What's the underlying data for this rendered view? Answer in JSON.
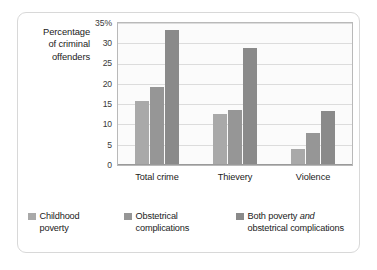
{
  "chart_data": {
    "type": "bar",
    "title": "",
    "subtitle": "",
    "xlabel": "",
    "ylabel": "Percentage of criminal offenders",
    "ylabel_lines": [
      "Percentage",
      "of criminal",
      "offenders"
    ],
    "categories": [
      "Total crime",
      "Thievery",
      "Violence"
    ],
    "series": [
      {
        "name": "Childhood poverty",
        "values": [
          15.5,
          12.3,
          3.8
        ],
        "color": "#a9a9a9"
      },
      {
        "name": "Obstetrical complications",
        "values": [
          19.0,
          13.4,
          7.7
        ],
        "color": "#969696"
      },
      {
        "name": "Both poverty and obstetrical complications",
        "values": [
          33.0,
          28.5,
          13.0
        ],
        "color": "#8a8a8a"
      }
    ],
    "ylim": [
      0,
      35
    ],
    "ytick_values": [
      0,
      5,
      10,
      15,
      20,
      25,
      30,
      35
    ],
    "ytick_labels": [
      "0",
      "5",
      "10",
      "15",
      "20",
      "25",
      "30",
      "35%"
    ],
    "grid": true,
    "legend_position": "bottom",
    "legend": [
      {
        "label_lines": [
          "Childhood",
          "poverty"
        ],
        "emphasis": "",
        "swatch": "#a9a9a9"
      },
      {
        "label_lines": [
          "Obstetrical",
          "complications"
        ],
        "emphasis": "",
        "swatch": "#969696"
      },
      {
        "label_lines": [
          "Both poverty and",
          "obstetrical complications"
        ],
        "emphasis": "and",
        "swatch": "#8a8a8a"
      }
    ]
  },
  "yticks": [
    {
      "label": "35%",
      "value": 35
    },
    {
      "label": "30",
      "value": 30
    },
    {
      "label": "25",
      "value": 25
    },
    {
      "label": "20",
      "value": 20
    },
    {
      "label": "15",
      "value": 15
    },
    {
      "label": "10",
      "value": 10
    },
    {
      "label": "5",
      "value": 5
    },
    {
      "label": "0",
      "value": 0
    }
  ],
  "axis_title": {
    "l1": "Percentage",
    "l2": "of criminal",
    "l3": "offenders"
  },
  "xticks": [
    {
      "label": "Total crime"
    },
    {
      "label": "Thievery"
    },
    {
      "label": "Violence"
    }
  ],
  "legend": [
    {
      "l1": "Childhood",
      "l2": "poverty"
    },
    {
      "l1": "Obstetrical",
      "l2": "complications"
    },
    {
      "l1_pre": "Both poverty ",
      "l1_em": "and",
      "l2": "obstetrical complications"
    }
  ]
}
